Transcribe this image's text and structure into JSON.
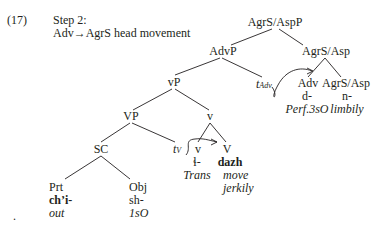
{
  "example": {
    "number": "(17)",
    "step": "Step 2:",
    "caption_prefix": "Adv",
    "arrow_glyph": "→",
    "caption_suffix": "AgrS head movement"
  },
  "tree": {
    "root": "AgrS/AspP",
    "advp": "AdvP",
    "agrs_asp": "AgrS/Asp",
    "vP": "vP",
    "trace_adv": {
      "base": "t",
      "sub": "Adv"
    },
    "adv": {
      "label": "Adv",
      "morph": "d-",
      "gloss": "Perf.3sO"
    },
    "agrs_asp_head": {
      "label": "AgrS/Asp",
      "morph": "n-",
      "gloss": "limbily"
    },
    "VP": "VP",
    "v_bar": "v",
    "SC": "SC",
    "trace_v": {
      "base": "t",
      "sub": "V"
    },
    "v_head": {
      "label": "v",
      "morph": "ɬ-",
      "gloss": "Trans"
    },
    "V_head": {
      "label": "V",
      "morph": "dazh",
      "gloss_line1": "move",
      "gloss_line2": "jerkily"
    },
    "prt": {
      "label": "Prt",
      "morph": "ch’i-",
      "gloss": "out"
    },
    "obj": {
      "label": "Obj",
      "morph": "sh-",
      "gloss": "1sO"
    }
  },
  "bullet": "."
}
